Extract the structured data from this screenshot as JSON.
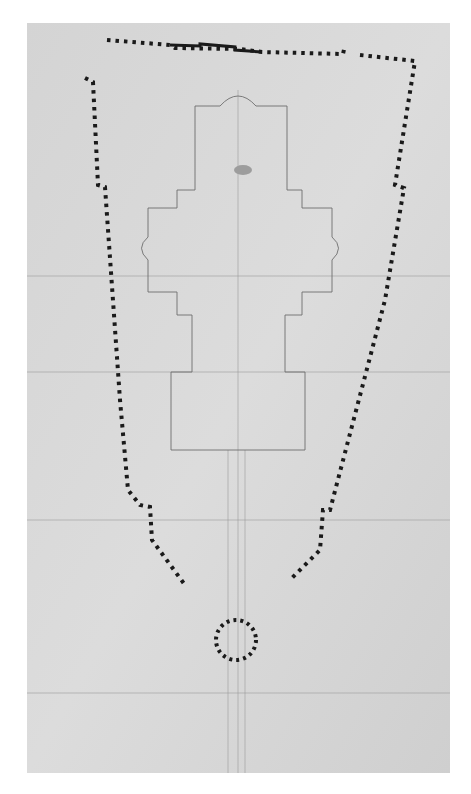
{
  "drawing": {
    "title": "",
    "kind": "architectural-ground-plan",
    "paper_color": "#d9d9d9",
    "ink_color": "#1a1a1a",
    "pencil_color": "#7a7a7a",
    "sheet": {
      "x": 27,
      "y": 23,
      "w": 423,
      "h": 750
    },
    "outer_wall_dotted_path": "M107,40 L170,45 L175,48 L240,49 L262,52 L343,54 L345,45 M360,55 L415,61 L395,185 L404,188 L385,300 L330,510 L323,510 L320,550 L290,580 M85,78 L93,82 L98,185 L105,187 L120,400 L128,490 L140,505 L150,507 L152,540 L185,585",
    "top_solid_wall_path": "M170,45 L200,46 L200,44 L235,47 L235,50 L262,52",
    "inner_plan_path": "M220,106 Q238,86 256,106 L287,106 L287,190 L302,190 L302,208 L332,208 L332,237 Q345,248 332,260 L332,292 L302,292 L302,315 L285,315 L285,372 L305,372 L305,450 L171,450 L171,372 L192,372 L192,315 L177,315 L177,292 L148,292 L148,260 Q135,248 148,237 L148,208 L177,208 L177,190 L195,190 L195,106 Z",
    "rotunda": {
      "cx": 236,
      "cy": 640,
      "r": 20
    },
    "construction_lines": [
      {
        "x1": 27,
        "y1": 276,
        "x2": 450,
        "y2": 276
      },
      {
        "x1": 27,
        "y1": 372,
        "x2": 450,
        "y2": 372
      },
      {
        "x1": 27,
        "y1": 520,
        "x2": 450,
        "y2": 520
      },
      {
        "x1": 27,
        "y1": 693,
        "x2": 450,
        "y2": 693
      },
      {
        "x1": 238,
        "y1": 90,
        "x2": 238,
        "y2": 773
      },
      {
        "x1": 228,
        "y1": 450,
        "x2": 228,
        "y2": 773
      },
      {
        "x1": 245,
        "y1": 450,
        "x2": 245,
        "y2": 773
      }
    ]
  }
}
